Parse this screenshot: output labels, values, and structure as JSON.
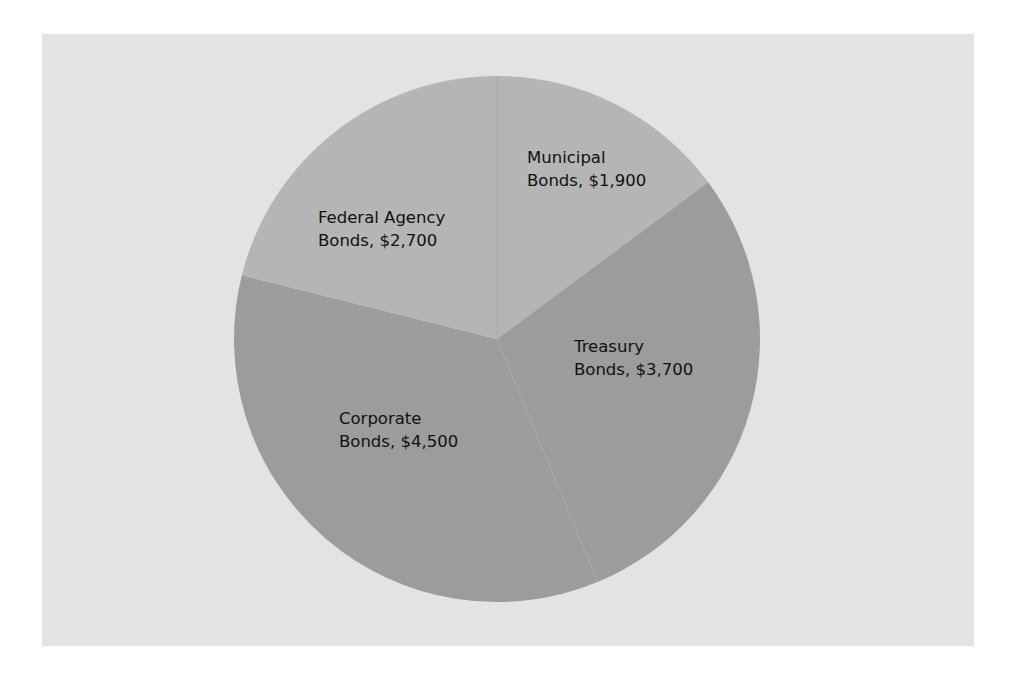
{
  "chart_data": {
    "type": "pie",
    "title": "",
    "categories": [
      "Municipal Bonds",
      "Treasury Bonds",
      "Corporate Bonds",
      "Federal Agency Bonds"
    ],
    "values": [
      1900,
      3700,
      4500,
      2700
    ],
    "unit": "$",
    "start_angle_deg": 0,
    "direction": "clockwise",
    "legend": "none (inline labels)",
    "colors": {
      "Municipal Bonds": "#b5b5b5",
      "Treasury Bonds": "#9c9c9c",
      "Corporate Bonds": "#9c9c9c",
      "Federal Agency Bonds": "#b5b5b5"
    },
    "background": "#e3e3e3"
  },
  "labels": {
    "municipal": {
      "line1": "Municipal",
      "line2": "Bonds, $1,900"
    },
    "treasury": {
      "line1": "Treasury",
      "line2": "Bonds, $3,700"
    },
    "corporate": {
      "line1": "Corporate",
      "line2": "Bonds, $4,500"
    },
    "federal": {
      "line1": "Federal Agency",
      "line2": "Bonds, $2,700"
    }
  }
}
